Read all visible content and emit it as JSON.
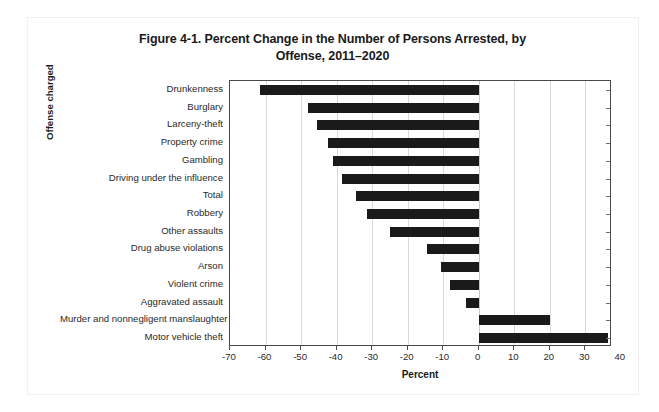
{
  "chart_data": {
    "type": "bar",
    "orientation": "horizontal",
    "title": "Figure 4-1. Percent Change in the Number of Persons Arrested, by Offense, 2011–2020",
    "title_line1": "Figure 4-1. Percent Change in the Number of Persons Arrested, by",
    "title_line2": "Offense, 2011–2020",
    "xlabel": "Percent",
    "ylabel": "Offense charged",
    "xlim": [
      -70,
      37.5
    ],
    "xticks": [
      -70,
      -60,
      -50,
      -40,
      -30,
      -20,
      -10,
      0,
      10,
      20,
      30,
      40
    ],
    "xticklabels": [
      "-70",
      "-60",
      "-50",
      "-40",
      "-30",
      "-20",
      "-10",
      "0",
      "10",
      "20",
      "30",
      "40"
    ],
    "grid": true,
    "grid_axis": "x",
    "legend": null,
    "bar_color": "#1a1a1a",
    "categories": [
      "Drunkenness",
      "Burglary",
      "Larceny-theft",
      "Property crime",
      "Gambling",
      "Driving under the influence",
      "Total",
      "Robbery",
      "Other assaults",
      "Drug abuse violations",
      "Arson",
      "Violent crime",
      "Aggravated assault",
      "Murder and nonnegligent manslaughter",
      "Motor vehicle theft"
    ],
    "values": [
      -61.5,
      -48.0,
      -45.5,
      -42.5,
      -41.0,
      -38.5,
      -34.5,
      -31.5,
      -25.0,
      -14.5,
      -10.5,
      -8.0,
      -3.5,
      20.0,
      36.5
    ]
  }
}
